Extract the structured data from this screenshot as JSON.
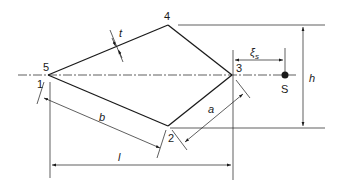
{
  "diagram": {
    "type": "cross-section-geometry",
    "nodes": [
      {
        "id": "5",
        "label": "5",
        "x": 48,
        "y": 75
      },
      {
        "id": "1",
        "label": "1",
        "x": 48,
        "y": 75
      },
      {
        "id": "4",
        "label": "4",
        "x": 168,
        "y": 25
      },
      {
        "id": "3",
        "label": "3",
        "x": 232,
        "y": 75
      },
      {
        "id": "2",
        "label": "2",
        "x": 168,
        "y": 126
      }
    ],
    "point_S": {
      "label": "S",
      "x": 285,
      "y": 75
    },
    "dimensions": {
      "t": "t",
      "b": "b",
      "a": "a",
      "l": "l",
      "h": "h",
      "xi_s": "ξ",
      "xi_s_sub": "s"
    },
    "colors": {
      "line": "#1a1a1a",
      "background": "#ffffff"
    }
  }
}
